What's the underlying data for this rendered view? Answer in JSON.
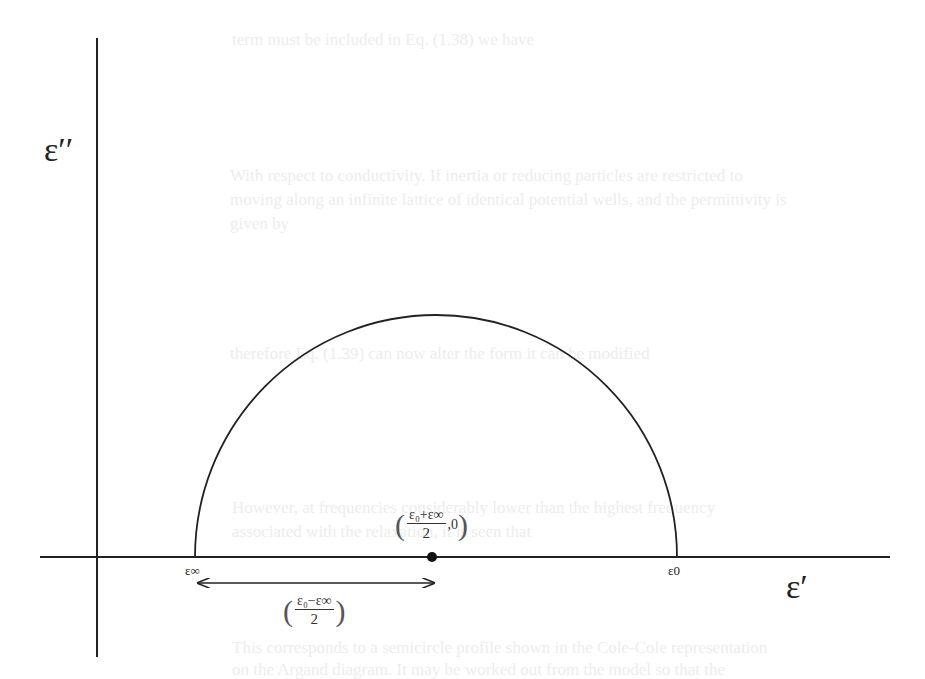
{
  "figure": {
    "type": "cole-cole-semicircle",
    "y_axis_label": "ε′′",
    "x_axis_label": "ε′",
    "left_intercept_label": "ε∞",
    "right_intercept_label": "ε0",
    "center_label": {
      "numerator": "ε₀+ε∞",
      "denominator": "2",
      "suffix": ",0"
    },
    "radius_label": {
      "numerator": "ε₀−ε∞",
      "denominator": "2"
    },
    "colors": {
      "line": "#222222",
      "background": "#ffffff",
      "ghost_text": "#ededed"
    }
  },
  "background_text": [
    "term must be included in Eq. (1.38) we have",
    "With respect to conductivity. If inertia or reducing particles are restricted to",
    "moving along an infinite lattice of identical potential wells, and the permittivity is",
    "given by",
    "therefore Eq. (1.39) can now alter the form it can be modified",
    "However, at frequencies considerably lower than the highest frequency",
    "associated with the relaxation, it is seen that",
    "This corresponds to a semicircle profile shown in the Cole-Cole representation",
    "on the Argand diagram. It may be worked out from the model so that the"
  ]
}
